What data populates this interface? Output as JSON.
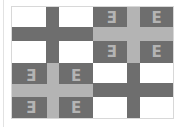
{
  "image": {
    "subject": "Byzantine tetragrammatic cross flag (grayscale)",
    "colors": {
      "white": "#ffffff",
      "dark": "#6e6e6e",
      "light": "#b4b4b4"
    },
    "quadrants": [
      {
        "position": "top-left",
        "background": "#ffffff",
        "cross": "#6e6e6e",
        "glyphs": []
      },
      {
        "position": "top-right",
        "background": "#6e6e6e",
        "cross": "#b4b4b4",
        "glyphs": [
          "Ǝ",
          "E",
          "Ǝ",
          "E"
        ]
      },
      {
        "position": "bottom-left",
        "background": "#6e6e6e",
        "cross": "#b4b4b4",
        "glyphs": [
          "Ǝ",
          "E",
          "Ǝ",
          "E"
        ]
      },
      {
        "position": "bottom-right",
        "background": "#ffffff",
        "cross": "#6e6e6e",
        "glyphs": []
      }
    ]
  }
}
